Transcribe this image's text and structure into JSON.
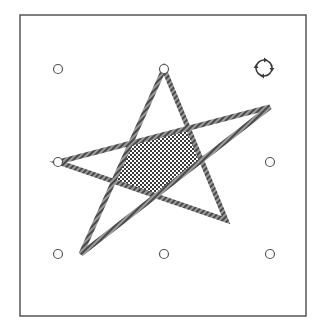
{
  "puzzle": {
    "title": "Star polygon puzzle",
    "frame": {
      "x": 20,
      "y": 15,
      "width": 286,
      "height": 301,
      "stroke": "#555555"
    },
    "pegs": [
      {
        "id": "peg-0-0",
        "cx": 58,
        "cy": 69
      },
      {
        "id": "peg-1-0",
        "cx": 164,
        "cy": 69
      },
      {
        "id": "peg-0-1",
        "cx": 58,
        "cy": 162
      },
      {
        "id": "peg-2-1",
        "cx": 270,
        "cy": 162
      },
      {
        "id": "peg-0-2",
        "cx": 58,
        "cy": 254
      },
      {
        "id": "peg-1-2",
        "cx": 164,
        "cy": 254
      },
      {
        "id": "peg-2-2",
        "cx": 270,
        "cy": 254
      }
    ],
    "star": {
      "vertices": [
        {
          "name": "top",
          "x": 164,
          "y": 69
        },
        {
          "name": "bottom-right",
          "x": 226,
          "y": 220
        },
        {
          "name": "left",
          "x": 58,
          "y": 162
        },
        {
          "name": "right",
          "x": 270,
          "y": 107
        },
        {
          "name": "bottom-left",
          "x": 81,
          "y": 254
        }
      ],
      "stroke_color": "#6a6a6a",
      "stroke_width": 5
    },
    "center_pentagon": {
      "fill_pattern": "checkerboard",
      "colors": [
        "#3a3a3a",
        "#ffffff"
      ]
    },
    "rotate_control": {
      "icon": "rotate-icon",
      "label": "Rotate"
    },
    "colors": {
      "background": "#ffffff",
      "peg_stroke": "#555555",
      "frame": "#555555"
    }
  }
}
